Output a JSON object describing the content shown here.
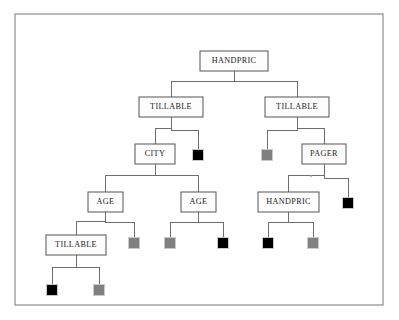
{
  "diagram": {
    "kind": "decision-tree",
    "title": "",
    "frame": {
      "x": 15,
      "y": 14,
      "width": 368,
      "height": 291,
      "border_color": "#8d8d8d"
    },
    "palette": {
      "node_border": "#555555",
      "node_fill": "#fdfdfd",
      "edge": "#6e6e6e",
      "leaf_black": "#000000",
      "leaf_gray": "#808080",
      "text": "#1a1a1a"
    },
    "node_labels": {
      "root": "HANDPRIC",
      "l1_left": "TILLABLE",
      "l1_right": "TILLABLE",
      "l2_city": "CITY",
      "l2_pager": "PAGER",
      "l3_age_left": "AGE",
      "l3_age_right": "AGE",
      "l3_handpric": "HANDPRIC",
      "l4_tillable": "TILLABLE"
    },
    "nodes": [
      {
        "id": "root",
        "label": "HANDPRIC",
        "type": "internal",
        "x": 200,
        "y": 51,
        "w": 68,
        "h": 20
      },
      {
        "id": "l1_left",
        "label": "TILLABLE",
        "type": "internal",
        "x": 139,
        "y": 97,
        "w": 64,
        "h": 20
      },
      {
        "id": "l1_right",
        "label": "TILLABLE",
        "type": "internal",
        "x": 265,
        "y": 97,
        "w": 64,
        "h": 20
      },
      {
        "id": "l2_city",
        "label": "CITY",
        "type": "internal",
        "x": 135,
        "y": 144,
        "w": 40,
        "h": 20
      },
      {
        "id": "l2_pager",
        "label": "PAGER",
        "type": "internal",
        "x": 302,
        "y": 144,
        "w": 44,
        "h": 20
      },
      {
        "id": "l3_age_left",
        "label": "AGE",
        "type": "internal",
        "x": 88,
        "y": 192,
        "w": 35,
        "h": 20
      },
      {
        "id": "l3_age_right",
        "label": "AGE",
        "type": "internal",
        "x": 181,
        "y": 192,
        "w": 35,
        "h": 20
      },
      {
        "id": "l3_handpric",
        "label": "HANDPRIC",
        "type": "internal",
        "x": 258,
        "y": 192,
        "w": 61,
        "h": 20
      },
      {
        "id": "l4_tillable",
        "label": "TILLABLE",
        "type": "internal",
        "x": 46,
        "y": 235,
        "w": 60,
        "h": 20
      }
    ],
    "leaves": [
      {
        "id": "leaf_a",
        "color": "black",
        "parent": "l1_left",
        "cx": 198,
        "cy": 155
      },
      {
        "id": "leaf_b",
        "color": "gray",
        "parent": "l1_right",
        "cx": 267,
        "cy": 155
      },
      {
        "id": "leaf_c",
        "color": "gray",
        "parent": "l3_age_left",
        "cx": 134,
        "cy": 243
      },
      {
        "id": "leaf_d",
        "color": "gray",
        "parent": "l3_age_right",
        "cx": 170,
        "cy": 243
      },
      {
        "id": "leaf_e",
        "color": "black",
        "parent": "l3_age_right",
        "cx": 223,
        "cy": 243
      },
      {
        "id": "leaf_f",
        "color": "black",
        "parent": "l2_pager",
        "cx": 348,
        "cy": 203
      },
      {
        "id": "leaf_g",
        "color": "black",
        "parent": "l3_handpric",
        "cx": 268,
        "cy": 243
      },
      {
        "id": "leaf_h",
        "color": "gray",
        "parent": "l3_handpric",
        "cx": 313,
        "cy": 243
      },
      {
        "id": "leaf_i",
        "color": "black",
        "parent": "l4_tillable",
        "cx": 52,
        "cy": 290
      },
      {
        "id": "leaf_j",
        "color": "gray",
        "parent": "l4_tillable",
        "cx": 99,
        "cy": 290
      }
    ],
    "leaf_size": 11,
    "edges": [
      {
        "from": "root",
        "to": "l1_left"
      },
      {
        "from": "root",
        "to": "l1_right"
      },
      {
        "from": "l1_left",
        "to": "l2_city"
      },
      {
        "from": "l1_left",
        "to": "leaf_a"
      },
      {
        "from": "l1_right",
        "to": "leaf_b"
      },
      {
        "from": "l1_right",
        "to": "l2_pager"
      },
      {
        "from": "l2_city",
        "to": "l3_age_left"
      },
      {
        "from": "l2_city",
        "to": "l3_age_right"
      },
      {
        "from": "l2_pager",
        "to": "l3_handpric"
      },
      {
        "from": "l2_pager",
        "to": "leaf_f"
      },
      {
        "from": "l3_age_left",
        "to": "l4_tillable"
      },
      {
        "from": "l3_age_left",
        "to": "leaf_c"
      },
      {
        "from": "l3_age_right",
        "to": "leaf_d"
      },
      {
        "from": "l3_age_right",
        "to": "leaf_e"
      },
      {
        "from": "l3_handpric",
        "to": "leaf_g"
      },
      {
        "from": "l3_handpric",
        "to": "leaf_h"
      },
      {
        "from": "l4_tillable",
        "to": "leaf_i"
      },
      {
        "from": "l4_tillable",
        "to": "leaf_j"
      }
    ]
  }
}
